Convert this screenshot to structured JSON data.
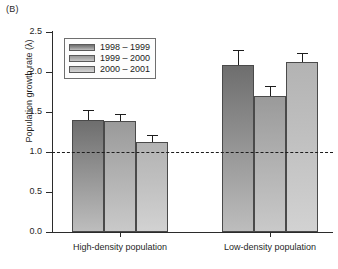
{
  "panel": {
    "label": "(B)"
  },
  "chart_data": {
    "type": "bar",
    "title": "",
    "panel_label": "(B)",
    "xlabel": "",
    "ylabel": "Population growth rate (λ)",
    "categories": [
      "High-density population",
      "Low-density population"
    ],
    "series": [
      {
        "name": "1998 – 1999",
        "values": [
          1.4,
          2.09
        ],
        "errors": [
          0.13,
          0.18
        ],
        "color": "#7d7d7d"
      },
      {
        "name": "1999 – 2000",
        "values": [
          1.39,
          1.7
        ],
        "errors": [
          0.09,
          0.12
        ],
        "color": "#a8a8a8"
      },
      {
        "name": "2000 – 2001",
        "values": [
          1.13,
          2.13
        ],
        "errors": [
          0.08,
          0.11
        ],
        "color": "#c2c2c2"
      }
    ],
    "ylim": [
      0.0,
      2.5
    ],
    "ytick_labels": [
      "0.0",
      "0.5",
      "1.0",
      "1.5",
      "2.0",
      "2.5"
    ],
    "ytick_values": [
      0.0,
      0.5,
      1.0,
      1.5,
      2.0,
      2.5
    ],
    "reference_line": {
      "value": 1.0,
      "style": "dashed"
    },
    "grid": false,
    "legend_position": "upper left",
    "error_bar_type": "upper"
  },
  "legend": {
    "entries": [
      "1998 – 1999",
      "1999 – 2000",
      "2000 – 2001"
    ]
  },
  "axes": {
    "y_title": "Population growth rate (λ)",
    "y_ticks": [
      "0.0",
      "0.5",
      "1.0",
      "1.5",
      "2.0",
      "2.5"
    ],
    "x_groups": [
      "High-density population",
      "Low-density population"
    ]
  }
}
